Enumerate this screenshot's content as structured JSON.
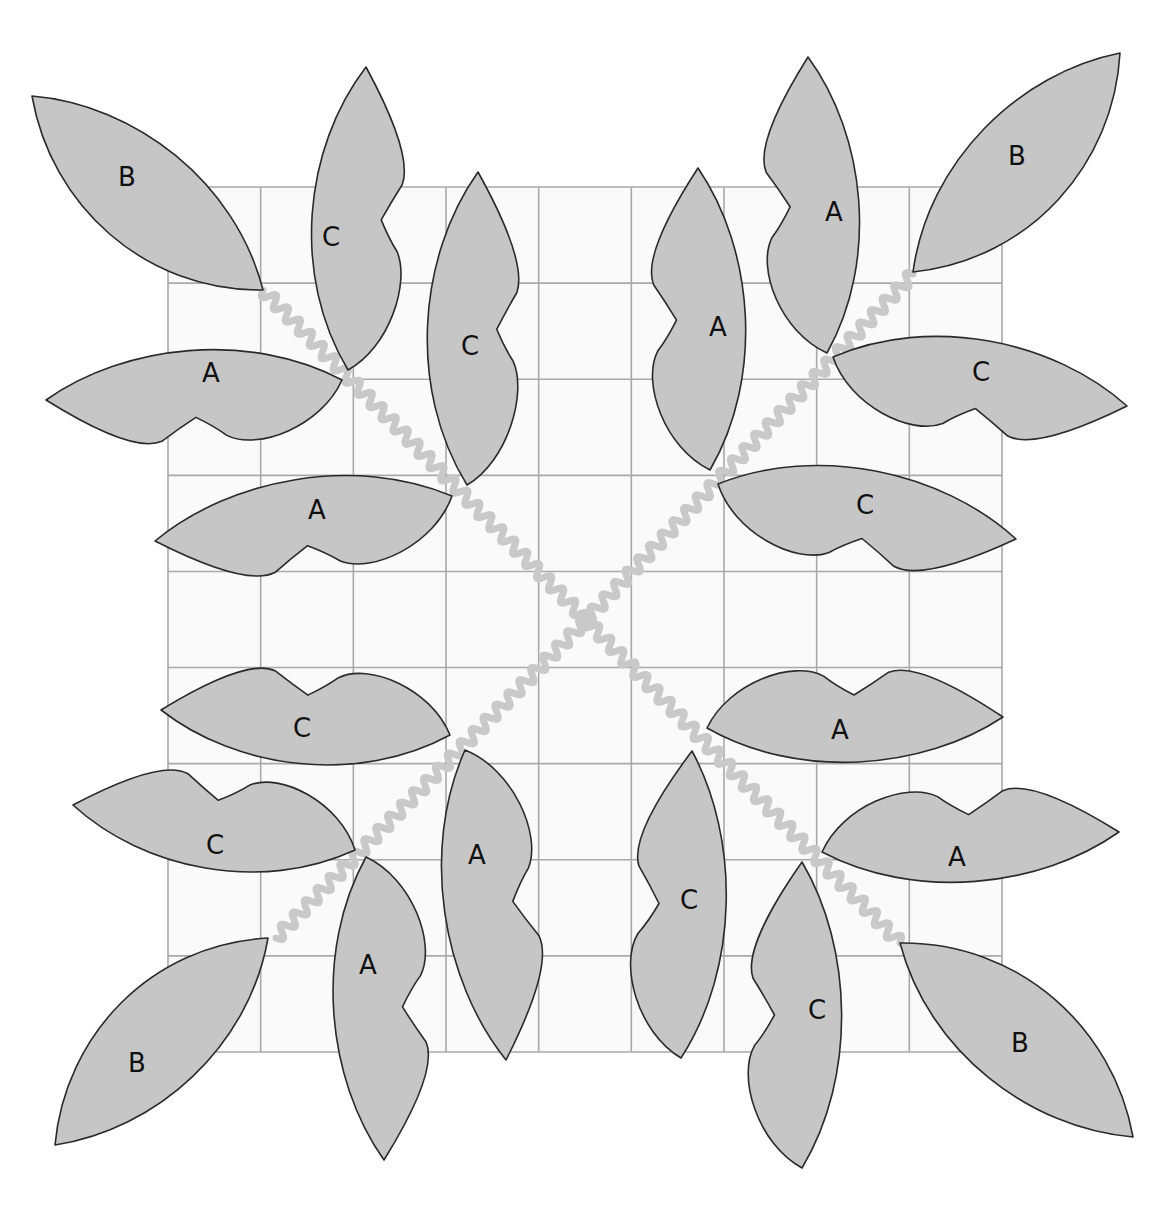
{
  "diagram": {
    "title": "",
    "colors": {
      "background": "#ffffff",
      "grid_fill": "#fafafa",
      "grid_line": "#a9a9a9",
      "stem": "#c9c9c9",
      "leaf_fill": "#c6c6c6",
      "leaf_outline": "#2a2a2a",
      "label": "#111111"
    },
    "grid": {
      "x0": 168,
      "y0": 187,
      "x1": 1002,
      "y1": 1052,
      "columns": 9,
      "rows": 9
    },
    "center": [
      586,
      620
    ],
    "stems": [
      {
        "name": "stem-top-left",
        "from": [
          263,
          290
        ],
        "to": [
          586,
          620
        ]
      },
      {
        "name": "stem-top-right",
        "from": [
          913,
          274
        ],
        "to": [
          586,
          620
        ]
      },
      {
        "name": "stem-bottom-left",
        "from": [
          276,
          938
        ],
        "to": [
          586,
          620
        ]
      },
      {
        "name": "stem-bottom-right",
        "from": [
          900,
          943
        ],
        "to": [
          586,
          620
        ]
      }
    ],
    "leaves": [
      {
        "quadrant": "top-left",
        "label": "B",
        "base": [
          263,
          290
        ],
        "tip": [
          32,
          96
        ],
        "wL": 62,
        "wR": 52,
        "notch": 0,
        "label_pos": [
          127,
          177
        ]
      },
      {
        "quadrant": "top-left",
        "label": "C",
        "base": [
          348,
          370
        ],
        "tip": [
          366,
          67
        ],
        "wL": 50,
        "wR": 44,
        "notch": 1,
        "label_pos": [
          331,
          237
        ]
      },
      {
        "quadrant": "top-left",
        "label": "C",
        "base": [
          467,
          485
        ],
        "tip": [
          478,
          172
        ],
        "wL": 50,
        "wR": 44,
        "notch": 1,
        "label_pos": [
          470,
          346
        ]
      },
      {
        "quadrant": "top-left",
        "label": "A",
        "base": [
          342,
          380
        ],
        "tip": [
          46,
          400
        ],
        "wL": 50,
        "wR": 44,
        "notch": -1,
        "label_pos": [
          211,
          373
        ]
      },
      {
        "quadrant": "top-left",
        "label": "A",
        "base": [
          452,
          496
        ],
        "tip": [
          155,
          541
        ],
        "wL": 50,
        "wR": 44,
        "notch": -1,
        "label_pos": [
          317,
          510
        ]
      },
      {
        "quadrant": "top-right",
        "label": "B",
        "base": [
          913,
          272
        ],
        "tip": [
          1120,
          53
        ],
        "wL": 52,
        "wR": 62,
        "notch": 0,
        "label_pos": [
          1017,
          156
        ]
      },
      {
        "quadrant": "top-right",
        "label": "A",
        "base": [
          827,
          353
        ],
        "tip": [
          808,
          57
        ],
        "wL": 50,
        "wR": 46,
        "notch": -1,
        "label_pos": [
          834,
          212
        ]
      },
      {
        "quadrant": "top-right",
        "label": "A",
        "base": [
          710,
          470
        ],
        "tip": [
          698,
          168
        ],
        "wL": 50,
        "wR": 46,
        "notch": -1,
        "label_pos": [
          718,
          327
        ]
      },
      {
        "quadrant": "top-right",
        "label": "C",
        "base": [
          833,
          357
        ],
        "tip": [
          1127,
          406
        ],
        "wL": 46,
        "wR": 50,
        "notch": 1,
        "label_pos": [
          981,
          372
        ]
      },
      {
        "quadrant": "top-right",
        "label": "C",
        "base": [
          718,
          484
        ],
        "tip": [
          1016,
          539
        ],
        "wL": 46,
        "wR": 50,
        "notch": 1,
        "label_pos": [
          865,
          505
        ]
      },
      {
        "quadrant": "bottom-left",
        "label": "C",
        "base": [
          450,
          735
        ],
        "tip": [
          161,
          710
        ],
        "wL": 46,
        "wR": 50,
        "notch": 1,
        "label_pos": [
          302,
          728
        ]
      },
      {
        "quadrant": "bottom-left",
        "label": "C",
        "base": [
          355,
          850
        ],
        "tip": [
          73,
          805
        ],
        "wL": 46,
        "wR": 50,
        "notch": 1,
        "label_pos": [
          215,
          845
        ]
      },
      {
        "quadrant": "bottom-left",
        "label": "B",
        "base": [
          268,
          938
        ],
        "tip": [
          55,
          1145
        ],
        "wL": 52,
        "wR": 62,
        "notch": 0,
        "label_pos": [
          137,
          1063
        ]
      },
      {
        "quadrant": "bottom-left",
        "label": "A",
        "base": [
          366,
          857
        ],
        "tip": [
          384,
          1160
        ],
        "wL": 50,
        "wR": 46,
        "notch": -1,
        "label_pos": [
          368,
          965
        ]
      },
      {
        "quadrant": "bottom-left",
        "label": "A",
        "base": [
          465,
          750
        ],
        "tip": [
          506,
          1060
        ],
        "wL": 50,
        "wR": 46,
        "notch": -1,
        "label_pos": [
          477,
          855
        ]
      },
      {
        "quadrant": "bottom-right",
        "label": "A",
        "base": [
          707,
          728
        ],
        "tip": [
          1003,
          717
        ],
        "wL": 50,
        "wR": 44,
        "notch": -1,
        "label_pos": [
          840,
          730
        ]
      },
      {
        "quadrant": "bottom-right",
        "label": "A",
        "base": [
          822,
          852
        ],
        "tip": [
          1119,
          832
        ],
        "wL": 50,
        "wR": 44,
        "notch": -1,
        "label_pos": [
          957,
          857
        ]
      },
      {
        "quadrant": "bottom-right",
        "label": "C",
        "base": [
          681,
          1058
        ],
        "tip": [
          692,
          751
        ],
        "wL": 50,
        "wR": 44,
        "notch": -1,
        "label_pos": [
          689,
          900
        ]
      },
      {
        "quadrant": "bottom-right",
        "label": "C",
        "base": [
          802,
          1168
        ],
        "tip": [
          802,
          862
        ],
        "wL": 50,
        "wR": 44,
        "notch": -1,
        "label_pos": [
          817,
          1010
        ]
      },
      {
        "quadrant": "bottom-right",
        "label": "B",
        "base": [
          900,
          943
        ],
        "tip": [
          1133,
          1137
        ],
        "wL": 62,
        "wR": 52,
        "notch": 0,
        "label_pos": [
          1020,
          1043
        ]
      }
    ]
  }
}
